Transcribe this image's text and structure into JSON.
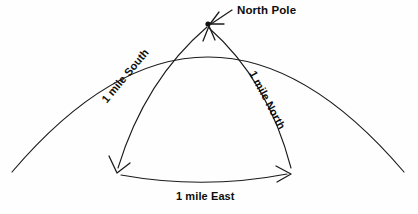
{
  "diagram": {
    "background_color": "#fefefe",
    "line_color": "#1a1a1a",
    "text_color": "#0d0d0d",
    "labels": {
      "north_pole": "North Pole",
      "mile_south": "1 mile South",
      "mile_north": "1 mile North",
      "mile_east": "1 mile East"
    },
    "vertices": {
      "pole": {
        "x": 208,
        "y": 24
      },
      "bottom_left": {
        "x": 117,
        "y": 172
      },
      "bottom_right": {
        "x": 290,
        "y": 172
      }
    },
    "paths": {
      "globe_arc": "M 12 172 Q 208 -58 404 172",
      "south_leg": "M 207 27 Q 145 80 118 168",
      "east_leg": "M 121 175 Q 204 190 287 174",
      "north_leg": "M 291 168 Q 268 80 209 28"
    },
    "arrows": [
      {
        "name": "south-arrow",
        "points_to": "bottom_left",
        "direction": "down-left"
      },
      {
        "name": "east-arrow",
        "points_to": "bottom_right",
        "direction": "right"
      },
      {
        "name": "north-arrow",
        "points_to": "pole",
        "direction": "up"
      },
      {
        "name": "pole-leader-arrow",
        "points_to": "pole",
        "direction": "down-left"
      }
    ]
  }
}
